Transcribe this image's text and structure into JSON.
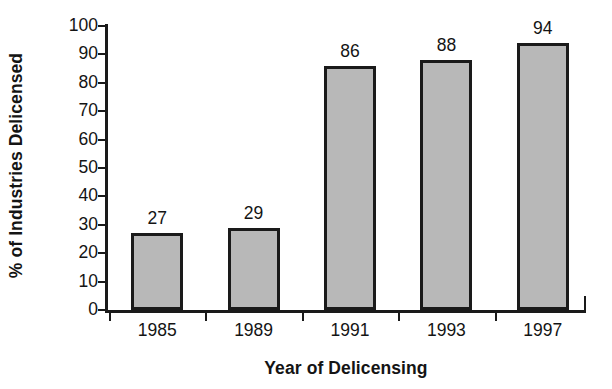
{
  "chart_data": {
    "type": "bar",
    "title": "",
    "subtitle": "",
    "categories": [
      "1985",
      "1989",
      "1991",
      "1993",
      "1997"
    ],
    "values": [
      27,
      29,
      86,
      88,
      94
    ],
    "data_labels": [
      "27",
      "29",
      "86",
      "88",
      "94"
    ],
    "xlabel": "Year of Delicensing",
    "ylabel": "% of Industries Delicensed",
    "ylim": [
      0,
      100
    ],
    "ytick_labels": [
      "0",
      "10",
      "20",
      "30",
      "40",
      "50",
      "60",
      "70",
      "80",
      "90",
      "100"
    ],
    "ytick_values": [
      0,
      10,
      20,
      30,
      40,
      50,
      60,
      70,
      80,
      90,
      100
    ],
    "grid": false,
    "legend": false,
    "legend_position": "none",
    "bar_fill_color": "#b8b8b8",
    "bar_border_color": "#1a1a1a",
    "axis_color": "#1a1a1a",
    "background_color": "#ffffff",
    "tick_direction": "out",
    "series": [
      {
        "name": "% of Industries Delicensed",
        "values": [
          27,
          29,
          86,
          88,
          94
        ]
      }
    ]
  }
}
